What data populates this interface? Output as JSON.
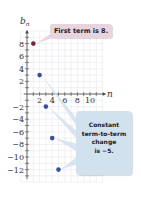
{
  "chart_data": {
    "type": "scatter",
    "title": "",
    "xlabel": "n",
    "ylabel": "b_n",
    "x_ticks": [
      2,
      4,
      6,
      8,
      10
    ],
    "y_ticks": [
      8,
      6,
      4,
      2,
      -2,
      -4,
      -6,
      -8,
      -10,
      -12
    ],
    "xlim": [
      0,
      12
    ],
    "ylim": [
      -14,
      10
    ],
    "grid": true,
    "series": [
      {
        "name": "b_n",
        "x": [
          1,
          2,
          3,
          4,
          5
        ],
        "y": [
          8,
          3,
          -2,
          -7,
          -12
        ]
      }
    ],
    "point_colors": [
      "#7a1f3d",
      "#3b4fa0",
      "#3b4fa0",
      "#3b4fa0",
      "#3b4fa0"
    ],
    "annotations": [
      {
        "text": "First term is 8.",
        "target": [
          1,
          8
        ],
        "color": "#e8d4de"
      },
      {
        "text": "Constant term-to-term change is −5.",
        "targets": [
          [
            2,
            3
          ],
          [
            3,
            -2
          ],
          [
            4,
            -7
          ],
          [
            5,
            -12
          ]
        ],
        "color": "#d2e1ee"
      }
    ]
  },
  "labels": {
    "y_axis": "b",
    "y_axis_sub": "n",
    "x_axis": "n",
    "callout_first": "First term is 8.",
    "callout_change_lines": [
      "Constant",
      "term-to-term",
      "change",
      "is −5."
    ]
  }
}
